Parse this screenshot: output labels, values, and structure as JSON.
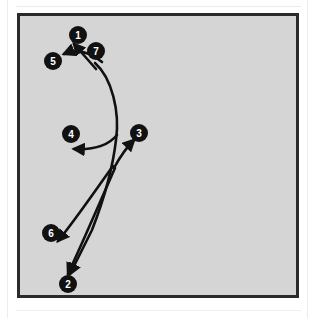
{
  "document": {
    "kind": "scanned-figure",
    "caption": "",
    "page_background": "#ffffff"
  },
  "figure": {
    "title": "",
    "panel": {
      "background_color": "#d5d5d5",
      "border_color": "#2a2a2a",
      "border_width_px": 3,
      "x": 17,
      "y": 13,
      "width": 282,
      "height": 285
    },
    "stroke_color": "#111111",
    "marker_fill": "#111111",
    "marker_text_color": "#ffffff",
    "marker_radius_px": 9,
    "stroke_count": 7,
    "markers": [
      {
        "label": "1",
        "cx": 58,
        "cy": 19,
        "name": "stroke-marker-1"
      },
      {
        "label": "7",
        "cx": 76,
        "cy": 35,
        "name": "stroke-marker-7"
      },
      {
        "label": "5",
        "cx": 33,
        "cy": 45,
        "name": "stroke-marker-5"
      },
      {
        "label": "4",
        "cx": 51,
        "cy": 118,
        "name": "stroke-marker-4"
      },
      {
        "label": "3",
        "cx": 119,
        "cy": 117,
        "name": "stroke-marker-3"
      },
      {
        "label": "6",
        "cx": 31,
        "cy": 217,
        "name": "stroke-marker-6"
      },
      {
        "label": "2",
        "cx": 48,
        "cy": 268,
        "name": "stroke-marker-2"
      }
    ],
    "strokes": [
      {
        "id": "stroke-1",
        "name": "stroke-path-1",
        "description": "short diagonal stroke rising to upper-right toward marker 1",
        "path": "M 76 53 L 54 28",
        "arrow_at": "end",
        "arrow_angle_deg": -131
      },
      {
        "id": "stroke-7",
        "name": "stroke-path-7",
        "description": "long arc curving down and right from near marker 7 then sweeping left-down to the lower junction",
        "path": "M 75 47 C 92 62, 100 96, 96 124 C 93 150, 86 178, 72 214 L 50 258",
        "arrow_at": "end",
        "arrow_angle_deg": 116
      },
      {
        "id": "stroke-5",
        "name": "stroke-path-5",
        "description": "short horizontal stroke curving left toward marker 5",
        "path": "M 82 46 C 70 36, 58 32, 44 38",
        "arrow_at": "end",
        "arrow_angle_deg": 157
      },
      {
        "id": "stroke-4",
        "name": "stroke-path-4",
        "description": "horizontal stroke sweeping left from the main curve to marker 4",
        "path": "M 97 119 C 88 130, 74 134, 54 133",
        "arrow_at": "end",
        "arrow_angle_deg": 183
      },
      {
        "id": "stroke-3",
        "name": "stroke-path-3",
        "description": "diagonal stroke rising to the upper-right toward marker 3",
        "path": "M 94 152 C 101 139, 108 130, 114 124",
        "arrow_at": "end",
        "arrow_angle_deg": -49
      },
      {
        "id": "stroke-6",
        "name": "stroke-path-6",
        "description": "diagonal stroke descending to the left toward marker 6",
        "path": "M 93 150 C 77 172, 56 203, 38 225",
        "arrow_at": "end",
        "arrow_angle_deg": 130
      },
      {
        "id": "stroke-2",
        "name": "stroke-path-2",
        "description": "long diagonal stroke descending to the lower-left toward marker 2",
        "path": "M 95 152 C 80 186, 62 228, 48 258",
        "arrow_at": "end",
        "arrow_angle_deg": 115
      }
    ]
  }
}
